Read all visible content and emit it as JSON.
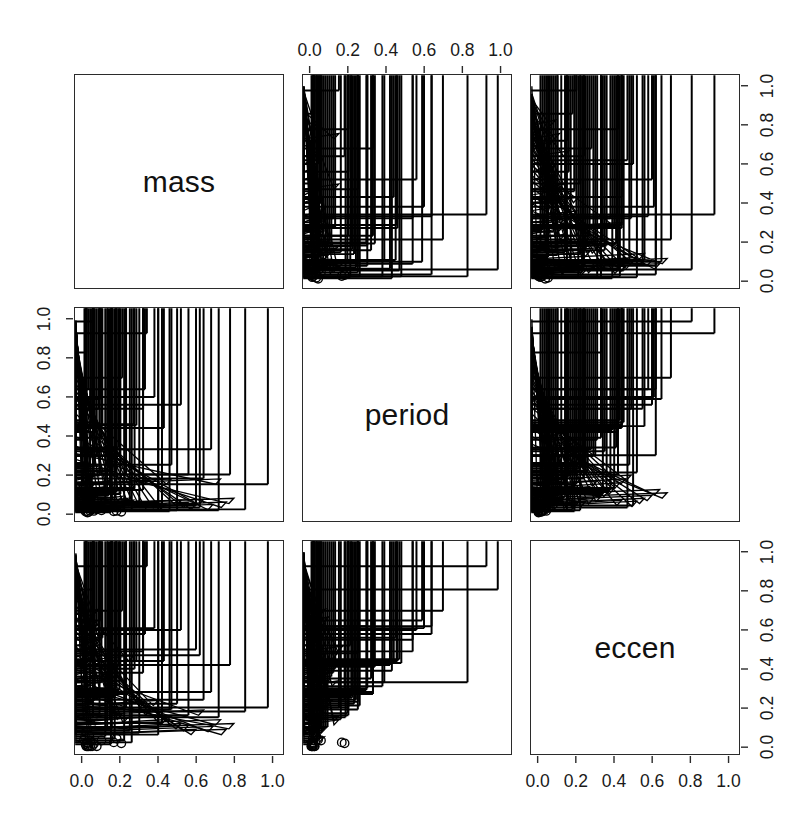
{
  "figure": {
    "type": "scatterplot-matrix",
    "variables": [
      "mass",
      "period",
      "eccen"
    ],
    "background": "#ffffff",
    "ink": "#000000",
    "axis_labels_top_cols": [
      2
    ],
    "axis_labels_bottom_cols": [
      1,
      3
    ],
    "axis_labels_left_rows": [
      2
    ],
    "axis_labels_right_rows": [
      1,
      3
    ]
  },
  "axes": {
    "ticks": [
      0.0,
      0.2,
      0.4,
      0.6,
      0.8,
      1.0
    ],
    "tick_labels": [
      "0.0",
      "0.2",
      "0.4",
      "0.6",
      "0.8",
      "1.0"
    ],
    "range": [
      -0.04,
      1.06
    ]
  },
  "diagonal": {
    "d0": "mass",
    "d1": "period",
    "d2": "eccen"
  },
  "legend": {
    "markers": [
      {
        "name": "plus",
        "glyph": "+",
        "desc": "plus symbol"
      },
      {
        "name": "triangle",
        "glyph": "△",
        "desc": "open triangle"
      },
      {
        "name": "circle",
        "glyph": "○",
        "desc": "open circle"
      }
    ]
  },
  "chart_data": {
    "type": "scatter",
    "title": "",
    "xlabel": "",
    "ylabel": "",
    "xlim": [
      0.0,
      1.0
    ],
    "ylim": [
      0.0,
      1.0
    ],
    "grid": false,
    "legend_position": "none",
    "variables": [
      "mass",
      "period",
      "eccen"
    ],
    "marker_groups": [
      "plus",
      "triangle",
      "circle"
    ],
    "points": [
      {
        "mass": 0.02,
        "period": 0.011,
        "eccen": 0.0,
        "marker": "circle"
      },
      {
        "mass": 0.026,
        "period": 0.004,
        "eccen": 0.0,
        "marker": "circle"
      },
      {
        "mass": 0.031,
        "period": 0.006,
        "eccen": 0.0,
        "marker": "circle"
      },
      {
        "mass": 0.016,
        "period": 0.009,
        "eccen": 0.01,
        "marker": "circle"
      },
      {
        "mass": 0.04,
        "period": 0.013,
        "eccen": 0.0,
        "marker": "circle"
      },
      {
        "mass": 0.05,
        "period": 0.022,
        "eccen": 0.0,
        "marker": "circle"
      },
      {
        "mass": 0.059,
        "period": 0.012,
        "eccen": 0.012,
        "marker": "circle"
      },
      {
        "mass": 0.022,
        "period": 0.165,
        "eccen": 0.02,
        "marker": "circle"
      },
      {
        "mass": 0.027,
        "period": 0.18,
        "eccen": 0.015,
        "marker": "circle"
      },
      {
        "mass": 0.075,
        "period": 0.02,
        "eccen": 0.0,
        "marker": "circle"
      },
      {
        "mass": 0.1,
        "period": 0.015,
        "eccen": 0.03,
        "marker": "circle"
      },
      {
        "mass": 0.165,
        "period": 0.01,
        "eccen": 0.02,
        "marker": "circle"
      },
      {
        "mass": 0.18,
        "period": 0.012,
        "eccen": 0.04,
        "marker": "circle"
      },
      {
        "mass": 0.205,
        "period": 0.008,
        "eccen": 0.015,
        "marker": "circle"
      },
      {
        "mass": 0.013,
        "period": 0.03,
        "eccen": 0.05,
        "marker": "circle"
      },
      {
        "mass": 0.035,
        "period": 0.028,
        "eccen": 0.055,
        "marker": "circle"
      },
      {
        "mass": 0.008,
        "period": 0.04,
        "eccen": 0.035,
        "marker": "circle"
      },
      {
        "mass": 0.042,
        "period": 0.055,
        "eccen": 0.03,
        "marker": "circle"
      },
      {
        "mass": 0.055,
        "period": 0.072,
        "eccen": 0.02,
        "marker": "triangle"
      },
      {
        "mass": 0.062,
        "period": 0.04,
        "eccen": 0.075,
        "marker": "triangle"
      },
      {
        "mass": 0.07,
        "period": 0.052,
        "eccen": 0.11,
        "marker": "triangle"
      },
      {
        "mass": 0.03,
        "period": 0.075,
        "eccen": 0.15,
        "marker": "triangle"
      },
      {
        "mass": 0.046,
        "period": 0.09,
        "eccen": 0.18,
        "marker": "triangle"
      },
      {
        "mass": 0.055,
        "period": 0.115,
        "eccen": 0.21,
        "marker": "triangle"
      },
      {
        "mass": 0.025,
        "period": 0.035,
        "eccen": 0.25,
        "marker": "triangle"
      },
      {
        "mass": 0.038,
        "period": 0.048,
        "eccen": 0.29,
        "marker": "triangle"
      },
      {
        "mass": 0.052,
        "period": 0.06,
        "eccen": 0.33,
        "marker": "triangle"
      },
      {
        "mass": 0.068,
        "period": 0.085,
        "eccen": 0.37,
        "marker": "triangle"
      },
      {
        "mass": 0.08,
        "period": 0.1,
        "eccen": 0.4,
        "marker": "triangle"
      },
      {
        "mass": 0.035,
        "period": 0.13,
        "eccen": 0.43,
        "marker": "triangle"
      },
      {
        "mass": 0.045,
        "period": 0.15,
        "eccen": 0.46,
        "marker": "triangle"
      },
      {
        "mass": 0.06,
        "period": 0.17,
        "eccen": 0.49,
        "marker": "triangle"
      },
      {
        "mass": 0.09,
        "period": 0.035,
        "eccen": 0.52,
        "marker": "triangle"
      },
      {
        "mass": 0.11,
        "period": 0.05,
        "eccen": 0.56,
        "marker": "triangle"
      },
      {
        "mass": 0.075,
        "period": 0.065,
        "eccen": 0.6,
        "marker": "triangle"
      },
      {
        "mass": 0.058,
        "period": 0.095,
        "eccen": 0.64,
        "marker": "triangle"
      },
      {
        "mass": 0.085,
        "period": 0.078,
        "eccen": 0.68,
        "marker": "triangle"
      },
      {
        "mass": 0.12,
        "period": 0.11,
        "eccen": 0.27,
        "marker": "triangle"
      },
      {
        "mass": 0.14,
        "period": 0.14,
        "eccen": 0.31,
        "marker": "triangle"
      },
      {
        "mass": 0.16,
        "period": 0.09,
        "eccen": 0.35,
        "marker": "triangle"
      },
      {
        "mass": 0.185,
        "period": 0.075,
        "eccen": 0.18,
        "marker": "triangle"
      },
      {
        "mass": 0.21,
        "period": 0.06,
        "eccen": 0.14,
        "marker": "triangle"
      },
      {
        "mass": 0.24,
        "period": 0.05,
        "eccen": 0.12,
        "marker": "triangle"
      },
      {
        "mass": 0.27,
        "period": 0.04,
        "eccen": 0.44,
        "marker": "triangle"
      },
      {
        "mass": 0.3,
        "period": 0.035,
        "eccen": 0.25,
        "marker": "triangle"
      },
      {
        "mass": 0.33,
        "period": 0.03,
        "eccen": 0.2,
        "marker": "triangle"
      },
      {
        "mass": 0.36,
        "period": 0.025,
        "eccen": 0.16,
        "marker": "triangle"
      },
      {
        "mass": 0.4,
        "period": 0.028,
        "eccen": 0.21,
        "marker": "triangle"
      },
      {
        "mass": 0.44,
        "period": 0.022,
        "eccen": 0.11,
        "marker": "triangle"
      },
      {
        "mass": 0.47,
        "period": 0.15,
        "eccen": 0.13,
        "marker": "triangle"
      },
      {
        "mass": 0.52,
        "period": 0.04,
        "eccen": 0.09,
        "marker": "triangle"
      },
      {
        "mass": 0.56,
        "period": 0.03,
        "eccen": 0.08,
        "marker": "triangle"
      },
      {
        "mass": 0.6,
        "period": 0.02,
        "eccen": 0.06,
        "marker": "triangle"
      },
      {
        "mass": 0.64,
        "period": 0.045,
        "eccen": 0.16,
        "marker": "triangle"
      },
      {
        "mass": 0.69,
        "period": 0.018,
        "eccen": 0.075,
        "marker": "triangle"
      },
      {
        "mass": 0.73,
        "period": 0.15,
        "eccen": 0.11,
        "marker": "triangle"
      },
      {
        "mass": 0.76,
        "period": 0.03,
        "eccen": 0.06,
        "marker": "triangle"
      },
      {
        "mass": 0.8,
        "period": 0.05,
        "eccen": 0.09,
        "marker": "triangle"
      },
      {
        "mass": 0.015,
        "period": 0.21,
        "eccen": 0.52,
        "marker": "plus"
      },
      {
        "mass": 0.055,
        "period": 0.99,
        "eccen": 0.81,
        "marker": "plus"
      },
      {
        "mass": 0.34,
        "period": 0.93,
        "eccen": 0.93,
        "marker": "plus"
      },
      {
        "mass": 0.02,
        "period": 0.83,
        "eccen": 0.33,
        "marker": "plus"
      },
      {
        "mass": 0.21,
        "period": 0.7,
        "eccen": 0.7,
        "marker": "plus"
      },
      {
        "mass": 0.03,
        "period": 0.64,
        "eccen": 0.62,
        "marker": "plus"
      },
      {
        "mass": 0.38,
        "period": 0.6,
        "eccen": 0.61,
        "marker": "plus"
      },
      {
        "mass": 0.33,
        "period": 0.64,
        "eccen": 0.58,
        "marker": "plus"
      },
      {
        "mass": 0.095,
        "period": 0.59,
        "eccen": 0.65,
        "marker": "plus"
      },
      {
        "mass": 0.085,
        "period": 0.54,
        "eccen": 0.55,
        "marker": "plus"
      },
      {
        "mass": 0.52,
        "period": 0.56,
        "eccen": 0.6,
        "marker": "plus"
      },
      {
        "mass": 0.32,
        "period": 0.54,
        "eccen": 0.49,
        "marker": "plus"
      },
      {
        "mass": 0.02,
        "period": 0.48,
        "eccen": 0.43,
        "marker": "plus"
      },
      {
        "mass": 0.05,
        "period": 0.47,
        "eccen": 0.45,
        "marker": "plus"
      },
      {
        "mass": 0.27,
        "period": 0.46,
        "eccen": 0.44,
        "marker": "plus"
      },
      {
        "mass": 0.285,
        "period": 0.455,
        "eccen": 0.44,
        "marker": "plus"
      },
      {
        "mass": 0.43,
        "period": 0.44,
        "eccen": 0.44,
        "marker": "plus"
      },
      {
        "mass": 0.01,
        "period": 0.43,
        "eccen": 0.39,
        "marker": "plus"
      },
      {
        "mass": 0.06,
        "period": 0.42,
        "eccen": 0.42,
        "marker": "plus"
      },
      {
        "mass": 0.02,
        "period": 0.38,
        "eccen": 0.31,
        "marker": "plus"
      },
      {
        "mass": 0.1,
        "period": 0.39,
        "eccen": 0.33,
        "marker": "plus"
      },
      {
        "mass": 0.19,
        "period": 0.34,
        "eccen": 0.41,
        "marker": "plus"
      },
      {
        "mass": 0.23,
        "period": 0.33,
        "eccen": 0.27,
        "marker": "plus"
      },
      {
        "mass": 0.155,
        "period": 0.32,
        "eccen": 0.35,
        "marker": "plus"
      },
      {
        "mass": 0.18,
        "period": 0.3,
        "eccen": 0.3,
        "marker": "plus"
      },
      {
        "mass": 0.195,
        "period": 0.295,
        "eccen": 0.29,
        "marker": "plus"
      },
      {
        "mass": 0.02,
        "period": 0.26,
        "eccen": 0.21,
        "marker": "plus"
      },
      {
        "mass": 0.04,
        "period": 0.25,
        "eccen": 0.23,
        "marker": "plus"
      },
      {
        "mass": 0.065,
        "period": 0.24,
        "eccen": 0.24,
        "marker": "plus"
      },
      {
        "mass": 0.135,
        "period": 0.23,
        "eccen": 0.22,
        "marker": "plus"
      },
      {
        "mass": 0.16,
        "period": 0.22,
        "eccen": 0.25,
        "marker": "plus"
      },
      {
        "mass": 0.175,
        "period": 0.215,
        "eccen": 0.26,
        "marker": "plus"
      },
      {
        "mass": 0.23,
        "period": 0.2,
        "eccen": 0.2,
        "marker": "plus"
      },
      {
        "mass": 0.09,
        "period": 0.195,
        "eccen": 0.17,
        "marker": "plus"
      },
      {
        "mass": 0.055,
        "period": 0.185,
        "eccen": 0.15,
        "marker": "plus"
      },
      {
        "mass": 0.145,
        "period": 0.16,
        "eccen": 0.14,
        "marker": "plus"
      },
      {
        "mass": 0.275,
        "period": 0.13,
        "eccen": 0.4,
        "marker": "plus"
      },
      {
        "mass": 0.32,
        "period": 0.12,
        "eccen": 0.38,
        "marker": "plus"
      },
      {
        "mass": 0.18,
        "period": 0.11,
        "eccen": 0.36,
        "marker": "plus"
      },
      {
        "mass": 0.2,
        "period": 0.1,
        "eccen": 0.34,
        "marker": "plus"
      },
      {
        "mass": 0.13,
        "period": 0.09,
        "eccen": 0.1,
        "marker": "plus"
      },
      {
        "mass": 0.155,
        "period": 0.08,
        "eccen": 0.09,
        "marker": "plus"
      },
      {
        "mass": 0.25,
        "period": 0.07,
        "eccen": 0.08,
        "marker": "plus"
      },
      {
        "mass": 0.3,
        "period": 0.06,
        "eccen": 0.07,
        "marker": "plus"
      },
      {
        "mass": 0.4,
        "period": 0.055,
        "eccen": 0.1,
        "marker": "plus"
      },
      {
        "mass": 0.42,
        "period": 0.05,
        "eccen": 0.12,
        "marker": "plus"
      },
      {
        "mass": 0.12,
        "period": 0.045,
        "eccen": 0.05,
        "marker": "plus"
      },
      {
        "mass": 0.17,
        "period": 0.035,
        "eccen": 0.04,
        "marker": "plus"
      },
      {
        "mass": 0.22,
        "period": 0.03,
        "eccen": 0.03,
        "marker": "plus"
      },
      {
        "mass": 0.6,
        "period": 0.04,
        "eccen": 0.5,
        "marker": "plus"
      },
      {
        "mass": 0.62,
        "period": 0.03,
        "eccen": 0.47,
        "marker": "plus"
      },
      {
        "mass": 0.78,
        "period": 0.2,
        "eccen": 0.42,
        "marker": "plus"
      },
      {
        "mass": 0.98,
        "period": 0.15,
        "eccen": 0.2,
        "marker": "plus"
      },
      {
        "mass": 0.86,
        "period": 0.02,
        "eccen": 0.18,
        "marker": "plus"
      },
      {
        "mass": 0.72,
        "period": 0.015,
        "eccen": 0.15,
        "marker": "plus"
      },
      {
        "mass": 0.5,
        "period": 0.015,
        "eccen": 0.22,
        "marker": "plus"
      },
      {
        "mass": 0.46,
        "period": 0.01,
        "eccen": 0.19,
        "marker": "plus"
      },
      {
        "mass": 0.68,
        "period": 0.33,
        "eccen": 0.28,
        "marker": "plus"
      },
      {
        "mass": 0.4,
        "period": 0.02,
        "eccen": 0.06,
        "marker": "plus"
      },
      {
        "mass": 0.26,
        "period": 0.015,
        "eccen": 0.02,
        "marker": "plus"
      },
      {
        "mass": 0.15,
        "period": 0.005,
        "eccen": 0.01,
        "marker": "plus"
      },
      {
        "mass": 0.075,
        "period": 0.3,
        "eccen": 0.62,
        "marker": "plus"
      },
      {
        "mass": 0.105,
        "period": 0.45,
        "eccen": 0.56,
        "marker": "plus"
      },
      {
        "mass": 0.09,
        "period": 0.25,
        "eccen": 0.48,
        "marker": "plus"
      },
      {
        "mass": 0.47,
        "period": 0.25,
        "eccen": 0.19,
        "marker": "plus"
      },
      {
        "mass": 0.56,
        "period": 0.2,
        "eccen": 0.16,
        "marker": "plus"
      },
      {
        "mass": 0.64,
        "period": 0.18,
        "eccen": 0.24,
        "marker": "plus"
      }
    ]
  }
}
